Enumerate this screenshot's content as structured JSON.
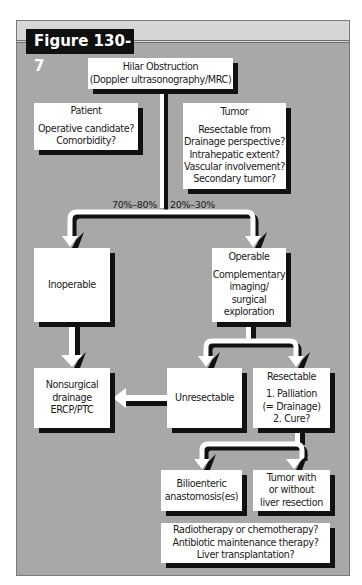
{
  "figure": {
    "label": "Figure 130-7"
  },
  "colors": {
    "background": "#a8a8a8",
    "top_strip": "#d6d6d6",
    "box": "#ffffff",
    "shadow": "#111111",
    "label_bg": "#0f0f0f"
  },
  "nodes": {
    "hilar": {
      "lines": [
        "Hilar Obstruction",
        "(Doppler ultrasonography/MRC)"
      ]
    },
    "patient": {
      "title": "Patient",
      "lines": [
        "Operative candidate?",
        "Comorbidity?"
      ]
    },
    "tumor": {
      "title": "Tumor",
      "lines": [
        "Resectable from",
        "Drainage perspective?",
        "Intrahepatic extent?",
        "Vascular involvement?",
        "Secondary tumor?"
      ]
    },
    "inoperable": {
      "title": "Inoperable"
    },
    "operable": {
      "title": "Operable",
      "lines": [
        "Complementary",
        "imaging/",
        "surgical",
        "exploration"
      ]
    },
    "nonsurgical": {
      "lines": [
        "Nonsurgical",
        "drainage",
        "ERCP/PTC"
      ]
    },
    "unresectable": {
      "title": "Unresectable"
    },
    "resectable": {
      "title": "Resectable",
      "lines": [
        "1. Palliation",
        "(= Drainage)",
        "2. Cure?"
      ]
    },
    "bilioenteric": {
      "lines": [
        "Bilioenteric",
        "anastomosis(es)"
      ]
    },
    "tumor_resection": {
      "lines": [
        "Tumor with",
        "or without",
        "liver resection"
      ]
    },
    "adjuvant": {
      "lines": [
        "Radiotherapy or chemotherapy?",
        "Antibiotic maintenance therapy?",
        "Liver transplantation?"
      ]
    }
  },
  "edges": {
    "split_left_label": "70%–80%",
    "split_right_label": "20%–30%"
  }
}
